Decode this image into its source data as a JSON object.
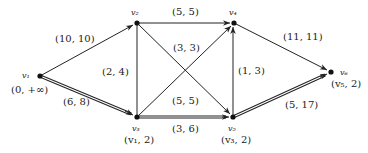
{
  "diagram": {
    "type": "flow-network",
    "nodes": [
      {
        "id": "v1",
        "label": "v₁",
        "mark": "(0, +∞)",
        "x": 40,
        "y": 76
      },
      {
        "id": "v2",
        "label": "v₂",
        "mark": "",
        "x": 137,
        "y": 23
      },
      {
        "id": "v3",
        "label": "v₃",
        "mark": "(v₁, 2)",
        "x": 137,
        "y": 117
      },
      {
        "id": "v4",
        "label": "v₄",
        "mark": "",
        "x": 234,
        "y": 23
      },
      {
        "id": "v5",
        "label": "v₅",
        "mark": "(v₃, 2)",
        "x": 233,
        "y": 117
      },
      {
        "id": "v6",
        "label": "v₆",
        "mark": "(v₅, 2)",
        "x": 331,
        "y": 72
      }
    ],
    "edges": [
      {
        "from": "v1",
        "to": "v2",
        "label": "(10, 10)",
        "path_edge": false
      },
      {
        "from": "v1",
        "to": "v3",
        "label": "(6, 8)",
        "path_edge": true
      },
      {
        "from": "v2",
        "to": "v4",
        "label": "(5, 5)",
        "path_edge": false
      },
      {
        "from": "v2",
        "to": "v3",
        "label": "(2, 4)",
        "path_edge": false
      },
      {
        "from": "v2",
        "to": "v5",
        "label": "(3, 3)",
        "path_edge": false
      },
      {
        "from": "v3",
        "to": "v4",
        "label": "(5, 5)",
        "path_edge": false
      },
      {
        "from": "v3",
        "to": "v5",
        "label": "(3, 6)",
        "path_edge": true
      },
      {
        "from": "v5",
        "to": "v4",
        "label": "(1, 3)",
        "path_edge": false
      },
      {
        "from": "v4",
        "to": "v6",
        "label": "(11, 11)",
        "path_edge": false
      },
      {
        "from": "v5",
        "to": "v6",
        "label": "(5, 17)",
        "path_edge": true
      }
    ]
  }
}
